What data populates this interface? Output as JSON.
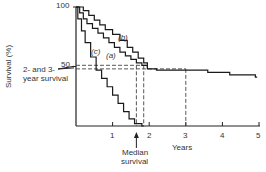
{
  "chart_data": {
    "type": "line",
    "title": "",
    "xlabel": "Years",
    "ylabel": "Survival (%)",
    "xlim": [
      0,
      5
    ],
    "ylim": [
      0,
      100
    ],
    "x_ticks": [
      "1",
      "2",
      "3",
      "4",
      "5"
    ],
    "y_ticks": [
      "50",
      "100"
    ],
    "grid": false,
    "legend": "inline labels",
    "series": [
      {
        "name": "(a)",
        "step": true,
        "x": [
          0,
          0.1,
          0.2,
          0.3,
          0.45,
          0.6,
          0.75,
          0.9,
          1.05,
          1.2,
          1.35,
          1.5,
          1.65,
          1.8,
          1.95,
          2.2,
          2.6,
          3.6,
          4.2,
          4.9
        ],
        "y": [
          100,
          95,
          90,
          86,
          82,
          78,
          74,
          70,
          66,
          62,
          59,
          56,
          53,
          51,
          48,
          47,
          47,
          45,
          43,
          41
        ]
      },
      {
        "name": "(b)",
        "step": true,
        "x": [
          0,
          0.2,
          0.35,
          0.5,
          0.65,
          0.8,
          1.0,
          1.2,
          1.4,
          1.55,
          1.7,
          1.85,
          1.95
        ],
        "y": [
          100,
          97,
          93,
          89,
          85,
          81,
          77,
          72,
          66,
          62,
          57,
          53,
          49
        ]
      },
      {
        "name": "(c)",
        "step": true,
        "x": [
          0,
          0.05,
          0.15,
          0.25,
          0.4,
          0.55,
          0.7,
          0.85,
          1.0,
          1.15,
          1.3,
          1.45,
          1.6,
          1.8
        ],
        "y": [
          100,
          90,
          80,
          70,
          58,
          47,
          40,
          33,
          26,
          19,
          12,
          6,
          2,
          0
        ]
      }
    ],
    "annotations": [
      {
        "text": "2- and 3- year survival",
        "points_to_y": [
          51,
          48
        ]
      },
      {
        "text": "Median survival",
        "x": 1.65
      },
      {
        "type": "dashed_vertical",
        "x": [
          1.65,
          1.85,
          3.0
        ]
      },
      {
        "type": "dashed_horizontal",
        "y": [
          51,
          48
        ]
      }
    ]
  },
  "labels": {
    "y_axis": "Survival (%)",
    "x_axis": "Years",
    "tick_100": "100",
    "tick_50": "50",
    "x1": "1",
    "x2": "2",
    "x3": "3",
    "x4": "4",
    "x5": "5",
    "series_a": "(a)",
    "series_b": "(b)",
    "series_c": "(c)",
    "two_three_line1": "2- and 3-",
    "two_three_line2": "year survival",
    "median_line1": "Median",
    "median_line2": "survival"
  }
}
